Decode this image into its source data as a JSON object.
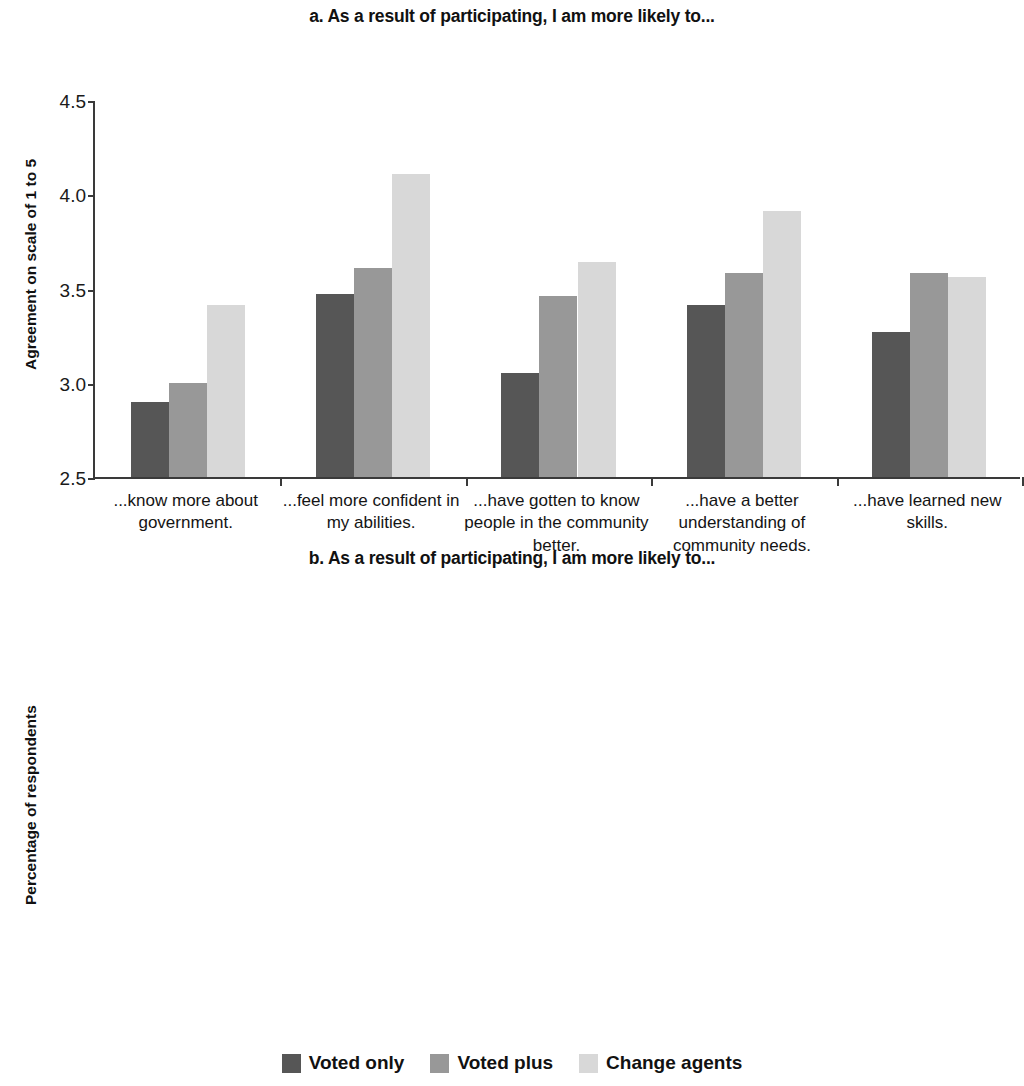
{
  "legend": {
    "position": "bottom-center",
    "entries": [
      {
        "label": "Voted only",
        "color": "#565656"
      },
      {
        "label": "Voted plus",
        "color": "#989898"
      },
      {
        "label": "Change agents",
        "color": "#d8d8d8"
      }
    ]
  },
  "chart_data": [
    {
      "id": "a",
      "type": "bar",
      "title": "a. As a result of participating, I am more likely to...",
      "xlabel": "",
      "ylabel": "Agreement on scale of 1 to 5",
      "ylim": [
        2.5,
        4.5
      ],
      "yticks": [
        "2.5",
        "3.0",
        "3.5",
        "4.0",
        "4.5"
      ],
      "ytick_values": [
        2.5,
        3.0,
        3.5,
        4.0,
        4.5
      ],
      "grid": false,
      "categories": [
        "...know more about government.",
        "...feel more confident in my abilities.",
        "...have gotten to know people in the community better.",
        "...have a better understanding of community needs.",
        "...have learned new skills."
      ],
      "series": [
        {
          "name": "Voted only",
          "color": "#565656",
          "values": [
            2.9,
            3.47,
            3.05,
            3.41,
            3.27
          ]
        },
        {
          "name": "Voted plus",
          "color": "#989898",
          "values": [
            3.0,
            3.61,
            3.46,
            3.58,
            3.58
          ]
        },
        {
          "name": "Change agents",
          "color": "#d8d8d8",
          "values": [
            3.41,
            4.11,
            3.64,
            3.91,
            3.56
          ]
        }
      ]
    },
    {
      "id": "b",
      "type": "bar",
      "title": "b. As a result of participating, I am more likely to...",
      "xlabel": "",
      "ylabel": "Percentage of respondents",
      "ylim": [
        0,
        0.9
      ],
      "yticks": [
        "0",
        "0.1",
        "0.2",
        "0.3",
        "0.4",
        "0.5",
        "0.6",
        "0.7",
        "0.8",
        "0.9"
      ],
      "ytick_values": [
        0,
        0.1,
        0.2,
        0.3,
        0.4,
        0.5,
        0.6,
        0.7,
        0.8,
        0.9
      ],
      "grid": false,
      "categories": [
        "...contact a public official.",
        "...vote in local and/or national elections.",
        "...consider working in politics.",
        "...volunteer for community projects.",
        "...work with others to solve community problems.",
        "...join a community group."
      ],
      "series": [
        {
          "name": "Voted only",
          "color": "#565656",
          "values": [
            0.11,
            0.335,
            0.08,
            0.35,
            0.22,
            0.225
          ]
        },
        {
          "name": "Voted plus",
          "color": "#989898",
          "values": [
            0.24,
            0.34,
            0.165,
            0.45,
            0.315,
            0.345
          ]
        },
        {
          "name": "Change agents",
          "color": "#d8d8d8",
          "values": [
            0.265,
            0.65,
            0.3,
            0.8,
            0.61,
            0.3
          ]
        }
      ]
    }
  ]
}
